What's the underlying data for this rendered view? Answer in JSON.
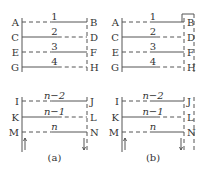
{
  "colors": {
    "stroke": "#555555",
    "text": "#333333",
    "background": "#ffffff"
  },
  "panels": [
    {
      "id": "a",
      "caption": "(a)",
      "x_left": 22,
      "x_right": 87,
      "upper_rows": [
        {
          "left": "A",
          "right": "B",
          "label": "1",
          "y": 22,
          "solid_from": 0.45,
          "solid_to": 1.0,
          "dash_from": 0.0,
          "dash_to": 0.45
        },
        {
          "left": "C",
          "right": "D",
          "label": "2",
          "y": 37,
          "solid_from": 0.0,
          "solid_to": 0.55,
          "dash_from": 0.55,
          "dash_to": 1.0
        },
        {
          "left": "E",
          "right": "F",
          "label": "3",
          "y": 52,
          "solid_from": 0.45,
          "solid_to": 1.0,
          "dash_from": 0.0,
          "dash_to": 0.45
        },
        {
          "left": "G",
          "right": "H",
          "label": "4",
          "y": 67,
          "solid_from": 0.0,
          "solid_to": 0.55,
          "dash_from": 0.55,
          "dash_to": 1.0
        }
      ],
      "lower_rows": [
        {
          "left": "I",
          "right": "J",
          "label": "n−2",
          "y": 101,
          "solid_from": 0.45,
          "solid_to": 1.0,
          "dash_from": 0.0,
          "dash_to": 0.45
        },
        {
          "left": "K",
          "right": "L",
          "label": "n−1",
          "y": 117,
          "solid_from": 0.0,
          "solid_to": 0.55,
          "dash_from": 0.55,
          "dash_to": 1.0
        },
        {
          "left": "M",
          "right": "N",
          "label": "n",
          "y": 132,
          "solid_from": 0.45,
          "solid_to": 1.0,
          "dash_from": 0.0,
          "dash_to": 0.45
        }
      ],
      "outer_dashed_column": false,
      "caption_y": 161
    },
    {
      "id": "b",
      "caption": "(b)",
      "x_left": 122,
      "x_right": 184,
      "upper_rows": [
        {
          "left": "A",
          "right": "B",
          "label": "1",
          "y": 22,
          "solid_from": 0.45,
          "solid_to": 1.0,
          "dash_from": 0.0,
          "dash_to": 0.45
        },
        {
          "left": "C",
          "right": "D",
          "label": "2",
          "y": 37,
          "solid_from": 0.0,
          "solid_to": 0.55,
          "dash_from": 0.55,
          "dash_to": 1.0
        },
        {
          "left": "E",
          "right": "F",
          "label": "3",
          "y": 52,
          "solid_from": 0.45,
          "solid_to": 1.0,
          "dash_from": 0.0,
          "dash_to": 0.45
        },
        {
          "left": "G",
          "right": "H",
          "label": "4",
          "y": 67,
          "solid_from": 0.0,
          "solid_to": 0.55,
          "dash_from": 0.55,
          "dash_to": 1.0
        }
      ],
      "lower_rows": [
        {
          "left": "I",
          "right": "J",
          "label": "n−2",
          "y": 101,
          "solid_from": 0.45,
          "solid_to": 1.0,
          "dash_from": 0.0,
          "dash_to": 0.45
        },
        {
          "left": "K",
          "right": "L",
          "label": "n−1",
          "y": 117,
          "solid_from": 0.0,
          "solid_to": 0.55,
          "dash_from": 0.55,
          "dash_to": 1.0
        },
        {
          "left": "M",
          "right": "N",
          "label": "n",
          "y": 132,
          "solid_from": 0.45,
          "solid_to": 1.0,
          "dash_from": 0.0,
          "dash_to": 0.45
        }
      ],
      "outer_dashed_column": true,
      "outer_x": 194,
      "caption_y": 161
    }
  ]
}
